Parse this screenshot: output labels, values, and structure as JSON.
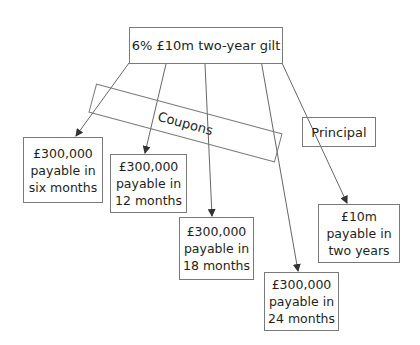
{
  "diagram": {
    "root": {
      "label": "6% £10m two-year gilt"
    },
    "groups": {
      "coupons": {
        "label": "Coupons"
      },
      "principal": {
        "label": "Principal"
      }
    },
    "payments": [
      {
        "lines": [
          "£300,000",
          "payable in",
          "six months"
        ]
      },
      {
        "lines": [
          "£300,000",
          "payable in",
          "12 months"
        ]
      },
      {
        "lines": [
          "£300,000",
          "payable in",
          "18 months"
        ]
      },
      {
        "lines": [
          "£300,000",
          "payable in",
          "24 months"
        ]
      },
      {
        "lines": [
          "£10m",
          "payable in",
          "two years"
        ]
      }
    ],
    "colors": {
      "border": "#7a7a7a",
      "line": "#555555",
      "text": "#231f20"
    }
  }
}
